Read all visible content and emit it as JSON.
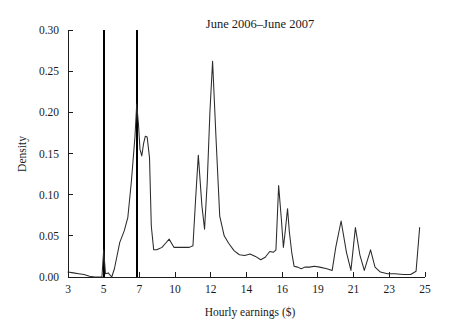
{
  "chart_data": {
    "type": "line",
    "title": "June 2006–June 2007",
    "xlabel": "Hourly earnings ($)",
    "ylabel": "Density",
    "xlim": [
      3,
      25
    ],
    "ylim": [
      0.0,
      0.3
    ],
    "grid": false,
    "legend": null,
    "xticks": [
      3,
      5,
      7,
      10,
      12,
      14,
      16,
      19,
      21,
      23,
      25
    ],
    "xtick_labels": [
      "3",
      "5",
      "7",
      "10",
      "12",
      "14",
      "16",
      "19",
      "21",
      "23",
      "25"
    ],
    "yticks": [
      0.0,
      0.05,
      0.1,
      0.15,
      0.2,
      0.25,
      0.3
    ],
    "ytick_labels": [
      "0.00",
      "0.05",
      "0.10",
      "0.15",
      "0.20",
      "0.25",
      "0.30"
    ],
    "series": [
      {
        "name": "Density of hourly earnings",
        "x": [
          3.0,
          3.3,
          3.6,
          3.9,
          4.2,
          4.5,
          4.75,
          4.9,
          5.0,
          5.1,
          5.25,
          5.45,
          5.6,
          5.9,
          6.15,
          6.35,
          6.55,
          6.75,
          6.85,
          6.95,
          7.05,
          7.2,
          7.35,
          7.5,
          7.65,
          7.85,
          8.0,
          8.2,
          8.45,
          8.6,
          8.9,
          9.2,
          9.5,
          9.7,
          9.9,
          10.2,
          10.5,
          10.8,
          11.0,
          11.15,
          11.3,
          11.5,
          11.65,
          11.8,
          11.95,
          12.1,
          12.3,
          12.5,
          12.75,
          13.0,
          13.3,
          13.6,
          13.9,
          14.2,
          14.5,
          14.8,
          15.05,
          15.3,
          15.5,
          15.65,
          15.8,
          15.95,
          16.1,
          16.25,
          16.45,
          16.6,
          16.8,
          17.0,
          17.3,
          17.6,
          17.9,
          18.3,
          18.7,
          19.1,
          19.5,
          19.8,
          20.0,
          20.3,
          20.6,
          20.85,
          21.1,
          21.35,
          21.6,
          21.95,
          22.2,
          22.5,
          22.9,
          23.3,
          23.8,
          24.2,
          24.5,
          24.7
        ],
        "y": [
          0.006,
          0.005,
          0.004,
          0.003,
          0.001,
          0.0,
          0.0,
          0.0,
          0.033,
          0.004,
          0.005,
          0.0,
          0.01,
          0.042,
          0.056,
          0.072,
          0.116,
          0.17,
          0.21,
          0.185,
          0.155,
          0.147,
          0.162,
          0.171,
          0.17,
          0.145,
          0.062,
          0.033,
          0.033,
          0.034,
          0.036,
          0.041,
          0.046,
          0.041,
          0.036,
          0.036,
          0.036,
          0.036,
          0.038,
          0.095,
          0.148,
          0.087,
          0.058,
          0.115,
          0.2,
          0.262,
          0.165,
          0.074,
          0.05,
          0.041,
          0.032,
          0.027,
          0.026,
          0.028,
          0.025,
          0.021,
          0.024,
          0.031,
          0.03,
          0.033,
          0.111,
          0.071,
          0.036,
          0.055,
          0.083,
          0.055,
          0.03,
          0.013,
          0.012,
          0.01,
          0.012,
          0.012,
          0.013,
          0.012,
          0.01,
          0.008,
          0.036,
          0.068,
          0.03,
          0.008,
          0.06,
          0.027,
          0.008,
          0.033,
          0.012,
          0.006,
          0.004,
          0.004,
          0.003,
          0.003,
          0.007,
          0.06
        ]
      }
    ],
    "annotations": [
      {
        "name": "federal-minimum-wage-line",
        "type": "vline",
        "x": 5.0,
        "y_from": 0.0,
        "y_to": 0.3
      },
      {
        "name": "state-minimum-wage-line",
        "type": "vline",
        "x": 6.85,
        "y_from": 0.0,
        "y_to": 0.3
      }
    ]
  }
}
